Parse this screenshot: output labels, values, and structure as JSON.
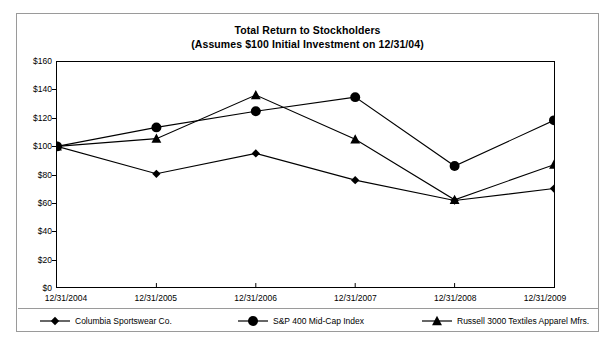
{
  "chart_data": {
    "type": "line",
    "title": "Total Return to Stockholders",
    "subtitle": "(Assumes $100 Initial Investment on 12/31/04)",
    "xlabel": "",
    "ylabel": "",
    "categories": [
      "12/31/2004",
      "12/31/2005",
      "12/31/2006",
      "12/31/2007",
      "12/31/2008",
      "12/31/2009"
    ],
    "ylim": [
      0,
      160
    ],
    "ytick_step": 20,
    "ytick_labels": [
      "$0",
      "$20",
      "$40",
      "$60",
      "$80",
      "$100",
      "$120",
      "$140",
      "$160"
    ],
    "ytick_values": [
      0,
      20,
      40,
      60,
      80,
      100,
      120,
      140,
      160
    ],
    "grid": false,
    "legend_position": "bottom",
    "series": [
      {
        "name": "Columbia Sportswear Co.",
        "marker": "diamond",
        "color": "#000000",
        "values": [
          100,
          80.5,
          95,
          76,
          61.5,
          70
        ]
      },
      {
        "name": "S&P 400 Mid-Cap Index",
        "marker": "circle",
        "color": "#000000",
        "values": [
          100,
          113.5,
          125,
          135,
          86,
          118.5
        ]
      },
      {
        "name": "Russell 3000 Textiles Apparel Mfrs.",
        "marker": "triangle",
        "color": "#000000",
        "values": [
          100,
          105.5,
          136.5,
          105,
          62,
          87
        ]
      }
    ]
  }
}
